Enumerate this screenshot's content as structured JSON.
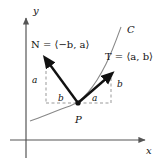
{
  "figure": {
    "background_color": "#ffffff",
    "stroke_color": "#111111",
    "axis_color": "#555555",
    "curve_color": "#777777",
    "dashed_color": "#999999",
    "axes": {
      "x_label": "x",
      "y_label": "y",
      "origin": {
        "x": 26,
        "y": 140
      }
    },
    "curve": {
      "name": "C",
      "label": "C",
      "label_x": 127,
      "label_y": 25
    },
    "point": {
      "label": "P",
      "x": 78,
      "y": 103
    },
    "vectors": [
      {
        "name": "normal",
        "symbol": "N",
        "equals": "=",
        "components": "⟨−b, a⟩",
        "label_full": "N = ⟨−b, a⟩",
        "tail_x": 78,
        "tail_y": 103,
        "head_x": 46,
        "head_y": 60,
        "label_x": 31,
        "label_y": 40
      },
      {
        "name": "tangent",
        "symbol": "T",
        "equals": "=",
        "components": "⟨a, b⟩",
        "label_full": "T = ⟨a, b⟩",
        "tail_x": 78,
        "tail_y": 103,
        "head_x": 111,
        "head_y": 74,
        "label_x": 105,
        "label_y": 52
      }
    ],
    "component_labels": [
      {
        "name": "normal-vertical-component",
        "text": "a",
        "x": 32,
        "y": 76
      },
      {
        "name": "normal-horizontal-component",
        "text": "b",
        "x": 58,
        "y": 94
      },
      {
        "name": "tangent-horizontal-component",
        "text": "a",
        "x": 92,
        "y": 94
      },
      {
        "name": "tangent-vertical-component",
        "text": "b",
        "x": 117,
        "y": 80
      }
    ]
  }
}
